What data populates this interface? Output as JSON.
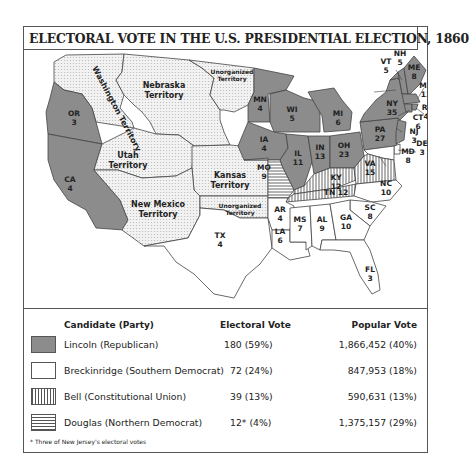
{
  "title": "ELECTORAL VOTE IN THE U.S. PRESIDENTIAL ELECTION, 1860",
  "colors": {
    "lincoln": "#8c8c8c",
    "breckinridge": "#ffffff",
    "bell_stripe": "#555555",
    "douglas_stripe": "#555555",
    "territory": "#e8e8e8",
    "border": "#555555"
  },
  "territories": [
    {
      "id": "washington",
      "label": "Washington Territory"
    },
    {
      "id": "nebraska",
      "label_line1": "Nebraska",
      "label_line2": "Territory"
    },
    {
      "id": "unorg-north",
      "label_line1": "Unorganized",
      "label_line2": "Territory"
    },
    {
      "id": "utah",
      "label_line1": "Utah",
      "label_line2": "Territory"
    },
    {
      "id": "kansas",
      "label_line1": "Kansas",
      "label_line2": "Territory"
    },
    {
      "id": "new-mexico",
      "label_line1": "New Mexico",
      "label_line2": "Territory"
    },
    {
      "id": "unorg-south",
      "label_line1": "Unorganized",
      "label_line2": "Territory"
    }
  ],
  "states": [
    {
      "abbr": "OR",
      "votes": "3",
      "winner": "Lincoln"
    },
    {
      "abbr": "CA",
      "votes": "4",
      "winner": "Lincoln"
    },
    {
      "abbr": "MN",
      "votes": "4",
      "winner": "Lincoln"
    },
    {
      "abbr": "WI",
      "votes": "5",
      "winner": "Lincoln"
    },
    {
      "abbr": "MI",
      "votes": "6",
      "winner": "Lincoln"
    },
    {
      "abbr": "IA",
      "votes": "4",
      "winner": "Lincoln"
    },
    {
      "abbr": "IL",
      "votes": "11",
      "winner": "Lincoln"
    },
    {
      "abbr": "IN",
      "votes": "13",
      "winner": "Lincoln"
    },
    {
      "abbr": "OH",
      "votes": "23",
      "winner": "Lincoln"
    },
    {
      "abbr": "PA",
      "votes": "27",
      "winner": "Lincoln"
    },
    {
      "abbr": "NY",
      "votes": "35",
      "winner": "Lincoln"
    },
    {
      "abbr": "VT",
      "votes": "5",
      "winner": "Lincoln"
    },
    {
      "abbr": "NH",
      "votes": "5",
      "winner": "Lincoln"
    },
    {
      "abbr": "ME",
      "votes": "8",
      "winner": "Lincoln"
    },
    {
      "abbr": "MA",
      "votes": "13",
      "winner": "Lincoln"
    },
    {
      "abbr": "RI",
      "votes": "4",
      "winner": "Lincoln"
    },
    {
      "abbr": "CT",
      "votes": "6",
      "winner": "Lincoln"
    },
    {
      "abbr": "NJ",
      "votes": "3",
      "winner": "Lincoln/Douglas"
    },
    {
      "abbr": "DE",
      "votes": "3",
      "winner": "Breckinridge"
    },
    {
      "abbr": "MD",
      "votes": "8",
      "winner": "Breckinridge"
    },
    {
      "abbr": "MO",
      "votes": "9",
      "winner": "Douglas"
    },
    {
      "abbr": "KY",
      "votes": "12",
      "winner": "Bell"
    },
    {
      "abbr": "VA",
      "votes": "15",
      "winner": "Bell"
    },
    {
      "abbr": "TN",
      "votes": "12",
      "winner": "Bell"
    },
    {
      "abbr": "NC",
      "votes": "10",
      "winner": "Breckinridge"
    },
    {
      "abbr": "SC",
      "votes": "8",
      "winner": "Breckinridge"
    },
    {
      "abbr": "GA",
      "votes": "10",
      "winner": "Breckinridge"
    },
    {
      "abbr": "AL",
      "votes": "9",
      "winner": "Breckinridge"
    },
    {
      "abbr": "MS",
      "votes": "7",
      "winner": "Breckinridge"
    },
    {
      "abbr": "LA",
      "votes": "6",
      "winner": "Breckinridge"
    },
    {
      "abbr": "AR",
      "votes": "4",
      "winner": "Breckinridge"
    },
    {
      "abbr": "TX",
      "votes": "4",
      "winner": "Breckinridge"
    },
    {
      "abbr": "FL",
      "votes": "3",
      "winner": "Breckinridge"
    }
  ],
  "legend": {
    "headers": {
      "candidate": "Candidate (Party)",
      "electoral": "Electoral Vote",
      "popular": "Popular Vote"
    },
    "rows": [
      {
        "candidate": "Lincoln (Republican)",
        "electoral": "180 (59%)",
        "popular": "1,866,452 (40%)",
        "pattern": "solid-gray"
      },
      {
        "candidate": "Breckinridge (Southern Democrat)",
        "electoral": "72 (24%)",
        "popular": "847,953 (18%)",
        "pattern": "white"
      },
      {
        "candidate": "Bell (Constitutional Union)",
        "electoral": "39 (13%)",
        "popular": "590,631 (13%)",
        "pattern": "vertical-stripes"
      },
      {
        "candidate": "Douglas (Northern Democrat)",
        "electoral": "12* (4%)",
        "popular": "1,375,157 (29%)",
        "pattern": "horizontal-stripes"
      }
    ],
    "footnote": "* Three of New Jersey's electoral votes"
  }
}
